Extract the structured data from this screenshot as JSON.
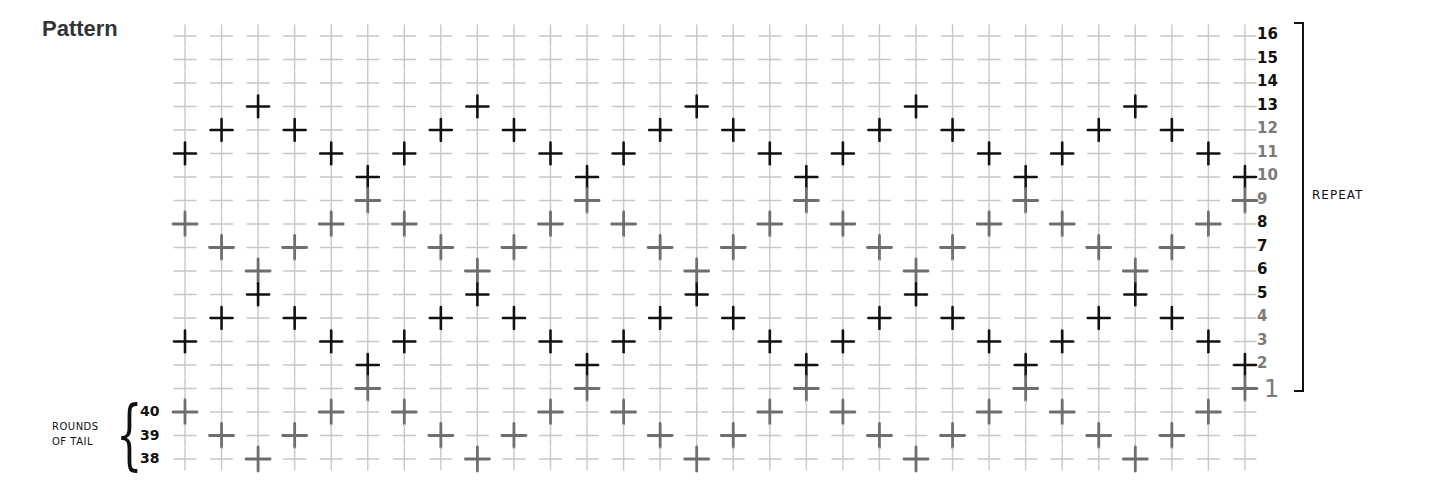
{
  "title": "Pattern",
  "legend": {
    "repeat_label": "REPEAT",
    "rounds_of_tail_label": [
      "ROUNDS",
      "OF TAIL"
    ]
  },
  "colors": {
    "background": "#ffffff",
    "grid_cross": "#c8c8c8",
    "dark_cross": "#111111",
    "medium_cross": "#6e6e6e",
    "label_dark": "#111111",
    "label_gray": "#7a7a7a"
  },
  "grid": {
    "columns": 30,
    "rows_top_to_bottom": [
      "16",
      "15",
      "14",
      "13",
      "12",
      "11",
      "10",
      "9",
      "8",
      "7",
      "6",
      "5",
      "4",
      "3",
      "2",
      "1",
      "40",
      "39",
      "38"
    ],
    "row_label_colors": {
      "16": "dark",
      "15": "dark",
      "14": "dark",
      "13": "dark",
      "12": "gray",
      "11": "gray",
      "10": "gray",
      "9": "gray",
      "8": "dark",
      "7": "dark",
      "6": "dark",
      "5": "dark",
      "4": "gray",
      "3": "gray",
      "2": "gray",
      "1": "gray"
    },
    "repeat_rows": "1-16",
    "tail_rows": [
      "40",
      "39",
      "38"
    ],
    "column_pattern_period": 6,
    "column_marks": [
      {
        "dark": [
          "11",
          "3"
        ],
        "medium": [
          "8",
          "40"
        ]
      },
      {
        "dark": [
          "12",
          "4"
        ],
        "medium": [
          "7",
          "39"
        ]
      },
      {
        "dark": [
          "13",
          "5"
        ],
        "medium": [
          "6",
          "38"
        ]
      },
      {
        "dark": [
          "12",
          "4"
        ],
        "medium": [
          "7",
          "39"
        ]
      },
      {
        "dark": [
          "11",
          "3"
        ],
        "medium": [
          "8",
          "40"
        ]
      },
      {
        "dark": [
          "10",
          "2"
        ],
        "medium": [
          "9",
          "1"
        ]
      },
      {
        "dark": [
          "11",
          "3"
        ],
        "medium": [
          "8",
          "40"
        ]
      },
      {
        "dark": [
          "12",
          "4"
        ],
        "medium": [
          "7",
          "39"
        ]
      },
      {
        "dark": [
          "13",
          "5"
        ],
        "medium": [
          "6",
          "38"
        ]
      },
      {
        "dark": [
          "12",
          "4"
        ],
        "medium": [
          "7",
          "39"
        ]
      },
      {
        "dark": [
          "11",
          "3"
        ],
        "medium": [
          "8",
          "40"
        ]
      },
      {
        "dark": [
          "10",
          "2"
        ],
        "medium": [
          "9",
          "1"
        ]
      },
      {
        "dark": [
          "11",
          "3"
        ],
        "medium": [
          "8",
          "40"
        ]
      },
      {
        "dark": [
          "12",
          "4"
        ],
        "medium": [
          "7",
          "39"
        ]
      },
      {
        "dark": [
          "13",
          "5"
        ],
        "medium": [
          "6",
          "38"
        ]
      },
      {
        "dark": [
          "12",
          "4"
        ],
        "medium": [
          "7",
          "39"
        ]
      },
      {
        "dark": [
          "11",
          "3"
        ],
        "medium": [
          "8",
          "40"
        ]
      },
      {
        "dark": [
          "10",
          "2"
        ],
        "medium": [
          "9",
          "1"
        ]
      },
      {
        "dark": [
          "11",
          "3"
        ],
        "medium": [
          "8",
          "40"
        ]
      },
      {
        "dark": [
          "12",
          "4"
        ],
        "medium": [
          "7",
          "39"
        ]
      },
      {
        "dark": [
          "13",
          "5"
        ],
        "medium": [
          "6",
          "38"
        ]
      },
      {
        "dark": [
          "12",
          "4"
        ],
        "medium": [
          "7",
          "39"
        ]
      },
      {
        "dark": [
          "11",
          "3"
        ],
        "medium": [
          "8",
          "40"
        ]
      },
      {
        "dark": [
          "10",
          "2"
        ],
        "medium": [
          "9",
          "1"
        ]
      },
      {
        "dark": [
          "11",
          "3"
        ],
        "medium": [
          "8",
          "40"
        ]
      },
      {
        "dark": [
          "12",
          "4"
        ],
        "medium": [
          "7",
          "39"
        ]
      },
      {
        "dark": [
          "13",
          "5"
        ],
        "medium": [
          "6",
          "38"
        ]
      },
      {
        "dark": [
          "12",
          "4"
        ],
        "medium": [
          "7",
          "39"
        ]
      },
      {
        "dark": [
          "11",
          "3"
        ],
        "medium": [
          "8",
          "40"
        ]
      },
      {
        "dark": [
          "10",
          "2"
        ],
        "medium": [
          "9",
          "1"
        ]
      }
    ]
  }
}
